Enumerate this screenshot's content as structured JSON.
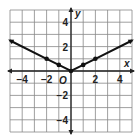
{
  "chart_data": {
    "type": "line",
    "title": "",
    "xlabel": "x",
    "ylabel": "y",
    "origin_label": "O",
    "xlim": [
      -5,
      5
    ],
    "ylim": [
      -5,
      5
    ],
    "grid": true,
    "grid_step": 1,
    "x_ticks": [
      "-4",
      "-2",
      "2",
      "4"
    ],
    "y_ticks": [
      "4",
      "2",
      "-2",
      "-4"
    ],
    "series": [
      {
        "name": "y = 0.5|x|",
        "x": [
          -5,
          -2,
          -1,
          0,
          1,
          2,
          5
        ],
        "y": [
          2.5,
          1,
          0.5,
          0,
          0.5,
          1,
          2.5
        ],
        "points_marked": [
          [
            -2,
            1
          ],
          [
            -1,
            0.5
          ],
          [
            0,
            0
          ],
          [
            1,
            0.5
          ],
          [
            2,
            1
          ]
        ],
        "arrows_at_ends": true
      }
    ],
    "colors": {
      "grid": "#888888",
      "axis": "#222222",
      "line": "#111111"
    }
  }
}
